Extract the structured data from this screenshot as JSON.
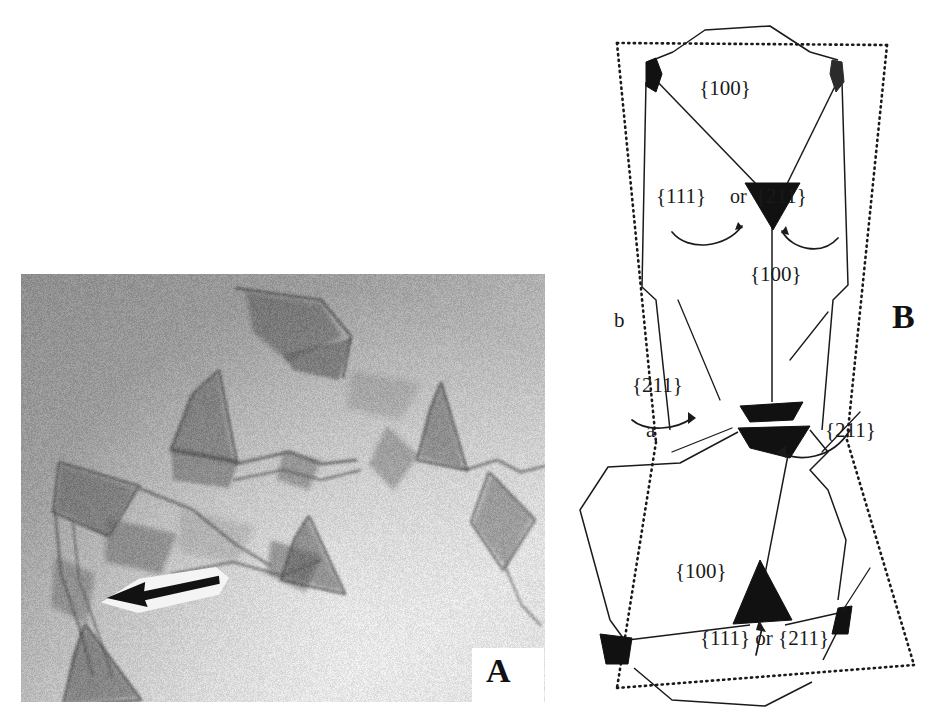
{
  "figure": {
    "panels": [
      {
        "id": "A",
        "label": "A",
        "type": "sem-micrograph",
        "description": "grayscale electron micrograph of faceted skeletal crystal network"
      },
      {
        "id": "B",
        "label": "B",
        "type": "line-diagram",
        "description": "schematic outline of crystal habit with indexed crystallographic facets"
      }
    ]
  },
  "panel_a": {
    "label": "A",
    "arrow": {
      "name": "pointer-arrow",
      "direction": "left"
    }
  },
  "panel_b": {
    "label": "B",
    "facet_labels": [
      {
        "id": "top-100",
        "text": "{100}",
        "x": 165,
        "y": 95
      },
      {
        "id": "upper-111",
        "text": "{111}",
        "x": 96,
        "y": 203
      },
      {
        "id": "upper-or",
        "text": "or",
        "x": 170,
        "y": 203
      },
      {
        "id": "upper-211",
        "text": "{211}",
        "x": 196,
        "y": 203
      },
      {
        "id": "mid-100",
        "text": "{100}",
        "x": 190,
        "y": 281
      },
      {
        "id": "left-211",
        "text": "{211}",
        "x": 72,
        "y": 392
      },
      {
        "id": "right-211",
        "text": "{211}",
        "x": 265,
        "y": 437
      },
      {
        "id": "lower-100",
        "text": "{100}",
        "x": 115,
        "y": 578
      },
      {
        "id": "bottom-111-211",
        "text": "{111} or {211}",
        "x": 140,
        "y": 645
      }
    ],
    "vertex_labels": [
      {
        "id": "vertex-b",
        "text": "b",
        "x": 54,
        "y": 327
      },
      {
        "id": "vertex-a",
        "text": "a",
        "x": 86,
        "y": 437
      }
    ]
  },
  "colors": {
    "ink": "#1a1a1a",
    "facet_fill": "#111111",
    "page_background": "#ffffff",
    "micrograph_mid": "#9a9a9a",
    "micrograph_light": "#d8d8d8",
    "micrograph_dark": "#636363"
  }
}
